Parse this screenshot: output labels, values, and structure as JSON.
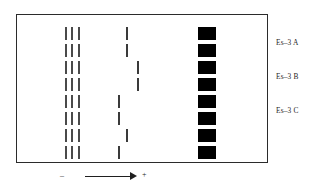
{
  "figure": {
    "type": "electrophoresis-zymogram",
    "title": "",
    "frame": {
      "x": 16,
      "y": 14,
      "width": 252,
      "height": 149,
      "border_color": "#2b2b2b"
    },
    "axis": {
      "negative_label": "–",
      "positive_label": "+",
      "arrow_direction": "right",
      "description": "migration direction from cathode to anode"
    },
    "genotype_labels": [
      {
        "text": "Es–3 A",
        "y": 38
      },
      {
        "text": "Es–3 B",
        "y": 72
      },
      {
        "text": "Es–3 C",
        "y": 106
      }
    ],
    "colors": {
      "band": "#4a4a4a",
      "square": "#000000",
      "frame": "#2b2b2b",
      "background": "#ffffff"
    },
    "lane_count": 8,
    "lanes": [
      {
        "index": 1,
        "y": 26,
        "bands": [
          65,
          71,
          78
        ],
        "variable_band": 126,
        "square": 198
      },
      {
        "index": 2,
        "y": 43,
        "bands": [
          65,
          71,
          78
        ],
        "variable_band": 126,
        "square": 198
      },
      {
        "index": 3,
        "y": 60,
        "bands": [
          65,
          71,
          78
        ],
        "variable_band": 137,
        "square": 198
      },
      {
        "index": 4,
        "y": 77,
        "bands": [
          65,
          71,
          78
        ],
        "variable_band": 137,
        "square": 198
      },
      {
        "index": 5,
        "y": 94,
        "bands": [
          65,
          71,
          78
        ],
        "variable_band": 118,
        "square": 198
      },
      {
        "index": 6,
        "y": 111,
        "bands": [
          65,
          71,
          78
        ],
        "variable_band": 118,
        "square": 198
      },
      {
        "index": 7,
        "y": 128,
        "bands": [
          65,
          71,
          78
        ],
        "variable_band": 126,
        "square": 198
      },
      {
        "index": 8,
        "y": 145,
        "bands": [
          65,
          71,
          78
        ],
        "variable_band": 118,
        "square": 198
      }
    ]
  }
}
